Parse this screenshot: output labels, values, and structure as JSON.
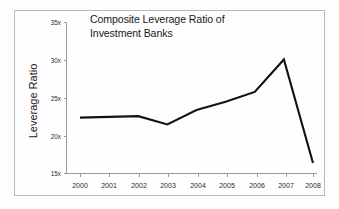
{
  "chart_data": {
    "type": "line",
    "title": "Composite Leverage Ratio of Investment Banks",
    "title_lines": [
      "Composite Leverage Ratio of",
      "Investment Banks"
    ],
    "xlabel": "",
    "ylabel": "Leverage Ratio",
    "categories": [
      "2000",
      "2001",
      "2002",
      "2003",
      "2004",
      "2005",
      "2006",
      "2007",
      "2008"
    ],
    "x": [
      2000,
      2001,
      2002,
      2003,
      2004,
      2005,
      2006,
      2007,
      2008
    ],
    "values": [
      22.4,
      22.5,
      22.6,
      21.5,
      23.4,
      24.5,
      25.8,
      30.1,
      16.4
    ],
    "series": [
      {
        "name": "Composite Leverage Ratio",
        "values": [
          22.4,
          22.5,
          22.6,
          21.5,
          23.4,
          24.5,
          25.8,
          30.1,
          16.4
        ]
      }
    ],
    "ylim": [
      15,
      35
    ],
    "yticks": [
      15,
      20,
      25,
      30,
      35
    ],
    "ytick_labels": [
      "15x",
      "20x",
      "25x",
      "30x",
      "35x"
    ],
    "xtick_labels": [
      "2000",
      "2001",
      "2002",
      "2003",
      "2004",
      "2005",
      "2006",
      "2007",
      "2008"
    ],
    "grid": false,
    "legend": false,
    "line_color": "#121212",
    "axis_color": "#9a9a9a",
    "background_color": "#fefefe",
    "frame_color": "#b9b9b9"
  }
}
